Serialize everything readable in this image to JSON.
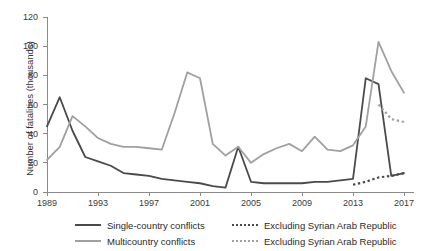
{
  "chart_data": {
    "type": "line",
    "title": "",
    "xlabel": "",
    "ylabel": "Number of fatalities (thousands)",
    "xlim": [
      1989,
      2017
    ],
    "ylim": [
      0,
      120
    ],
    "yticks": [
      0,
      20,
      40,
      60,
      80,
      100,
      120
    ],
    "xticks": [
      1989,
      1993,
      1997,
      2001,
      2005,
      2009,
      2013,
      2017
    ],
    "grid": false,
    "legend_position": "bottom",
    "x": [
      1989,
      1990,
      1991,
      1992,
      1993,
      1994,
      1995,
      1996,
      1997,
      1998,
      1999,
      2000,
      2001,
      2002,
      2003,
      2004,
      2005,
      2006,
      2007,
      2008,
      2009,
      2010,
      2011,
      2012,
      2013,
      2014,
      2015,
      2016,
      2017
    ],
    "series": [
      {
        "name": "Single-country conflicts",
        "style": "solid",
        "color": "#4a4a4a",
        "values": [
          45,
          65,
          42,
          24,
          21,
          18,
          13,
          12,
          11,
          9,
          8,
          7,
          6,
          4,
          3,
          31,
          7,
          6,
          6,
          6,
          6,
          7,
          7,
          8,
          9,
          78,
          74,
          11,
          13
        ]
      },
      {
        "name": "Multicountry conflicts",
        "style": "solid",
        "color": "#a0a0a0",
        "values": [
          22,
          31,
          52,
          45,
          37,
          33,
          31,
          31,
          30,
          29,
          54,
          82,
          78,
          33,
          25,
          31,
          20,
          26,
          30,
          33,
          28,
          38,
          29,
          28,
          32,
          45,
          103,
          83,
          68
        ]
      },
      {
        "name": "Excluding Syrian Arab Republic",
        "style": "dotted",
        "color": "#4a4a4a",
        "values": [
          null,
          null,
          null,
          null,
          null,
          null,
          null,
          null,
          null,
          null,
          null,
          null,
          null,
          null,
          null,
          null,
          null,
          null,
          null,
          null,
          null,
          null,
          null,
          null,
          5,
          7,
          10,
          11,
          13
        ]
      },
      {
        "name": "Excluding Syrian Arab Republic",
        "style": "dotted",
        "color": "#a0a0a0",
        "values": [
          null,
          null,
          null,
          null,
          null,
          null,
          null,
          null,
          null,
          null,
          null,
          null,
          null,
          null,
          null,
          null,
          null,
          null,
          null,
          null,
          null,
          null,
          null,
          null,
          null,
          null,
          60,
          50,
          48
        ]
      }
    ]
  },
  "axes": {
    "y_title": "Number of fatalities (thousands)",
    "y_tick_labels": [
      "0",
      "20",
      "40",
      "60",
      "80",
      "100",
      "120"
    ],
    "x_tick_labels": [
      "1989",
      "1993",
      "1997",
      "2001",
      "2005",
      "2009",
      "2013",
      "2017"
    ]
  },
  "legend": {
    "items": [
      {
        "label": "Single-country conflicts",
        "style": "solid",
        "color": "#4a4a4a"
      },
      {
        "label": "Excluding Syrian Arab Republic",
        "style": "dotted",
        "color": "#4a4a4a"
      },
      {
        "label": "Multicountry conflicts",
        "style": "solid",
        "color": "#a0a0a0"
      },
      {
        "label": "Excluding Syrian Arab Republic",
        "style": "dotted",
        "color": "#a0a0a0"
      }
    ]
  }
}
